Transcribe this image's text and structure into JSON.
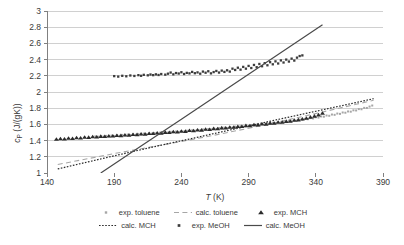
{
  "chart_data": {
    "type": "scatter",
    "title": "",
    "xlabel": "T (K)",
    "ylabel": "cP (J/(gK))",
    "xlim": [
      140,
      390
    ],
    "ylim": [
      1,
      3
    ],
    "xticks": [
      140,
      190,
      240,
      290,
      340,
      390
    ],
    "yticks": [
      1,
      1.2,
      1.4,
      1.6,
      1.8,
      2,
      2.2,
      2.4,
      2.6,
      2.8,
      3
    ],
    "grid": "horizontal",
    "legend_position": "bottom",
    "axis_color": "#808080",
    "grid_color": "#d0d0d0",
    "series": [
      {
        "name": "exp. toluene",
        "key": "exp-toluene",
        "style": "scatter",
        "marker": "square",
        "color": "#a6a6a6",
        "marker_size": 2.0,
        "points": [
          [
            176,
            1.452
          ],
          [
            178,
            1.448
          ],
          [
            180,
            1.455
          ],
          [
            182,
            1.45
          ],
          [
            184,
            1.458
          ],
          [
            186,
            1.452
          ],
          [
            188,
            1.462
          ],
          [
            190,
            1.455
          ],
          [
            192,
            1.468
          ],
          [
            194,
            1.46
          ],
          [
            196,
            1.47
          ],
          [
            198,
            1.464
          ],
          [
            200,
            1.474
          ],
          [
            202,
            1.468
          ],
          [
            204,
            1.478
          ],
          [
            206,
            1.472
          ],
          [
            208,
            1.482
          ],
          [
            210,
            1.476
          ],
          [
            212,
            1.486
          ],
          [
            214,
            1.48
          ],
          [
            216,
            1.49
          ],
          [
            218,
            1.486
          ],
          [
            220,
            1.494
          ],
          [
            222,
            1.49
          ],
          [
            224,
            1.498
          ],
          [
            226,
            1.494
          ],
          [
            228,
            1.503
          ],
          [
            230,
            1.498
          ],
          [
            232,
            1.508
          ],
          [
            234,
            1.503
          ],
          [
            236,
            1.512
          ],
          [
            238,
            1.508
          ],
          [
            240,
            1.517
          ],
          [
            242,
            1.512
          ],
          [
            244,
            1.522
          ],
          [
            246,
            1.518
          ],
          [
            248,
            1.527
          ],
          [
            250,
            1.522
          ],
          [
            252,
            1.532
          ],
          [
            254,
            1.528
          ],
          [
            256,
            1.538
          ],
          [
            258,
            1.533
          ],
          [
            260,
            1.543
          ],
          [
            262,
            1.538
          ],
          [
            264,
            1.548
          ],
          [
            266,
            1.544
          ],
          [
            268,
            1.554
          ],
          [
            270,
            1.549
          ],
          [
            272,
            1.56
          ],
          [
            274,
            1.555
          ],
          [
            276,
            1.566
          ],
          [
            278,
            1.561
          ],
          [
            280,
            1.572
          ],
          [
            282,
            1.567
          ],
          [
            284,
            1.578
          ],
          [
            286,
            1.573
          ],
          [
            288,
            1.584
          ],
          [
            290,
            1.58
          ],
          [
            292,
            1.59
          ],
          [
            294,
            1.586
          ],
          [
            296,
            1.597
          ],
          [
            298,
            1.592
          ],
          [
            300,
            1.604
          ],
          [
            302,
            1.599
          ],
          [
            304,
            1.611
          ],
          [
            306,
            1.606
          ],
          [
            308,
            1.618
          ],
          [
            310,
            1.614
          ],
          [
            312,
            1.626
          ],
          [
            314,
            1.621
          ],
          [
            316,
            1.634
          ],
          [
            318,
            1.629
          ],
          [
            320,
            1.642
          ],
          [
            322,
            1.637
          ],
          [
            324,
            1.65
          ],
          [
            326,
            1.646
          ],
          [
            328,
            1.659
          ],
          [
            330,
            1.655
          ],
          [
            332,
            1.668
          ],
          [
            334,
            1.664
          ],
          [
            336,
            1.678
          ],
          [
            338,
            1.673
          ],
          [
            340,
            1.688
          ],
          [
            342,
            1.684
          ],
          [
            344,
            1.698
          ],
          [
            346,
            1.695
          ],
          [
            348,
            1.71
          ],
          [
            350,
            1.706
          ],
          [
            352,
            1.722
          ],
          [
            354,
            1.718
          ],
          [
            356,
            1.734
          ],
          [
            358,
            1.73
          ],
          [
            360,
            1.747
          ],
          [
            362,
            1.744
          ],
          [
            364,
            1.76
          ],
          [
            366,
            1.757
          ],
          [
            368,
            1.774
          ],
          [
            370,
            1.772
          ],
          [
            372,
            1.789
          ],
          [
            374,
            1.787
          ],
          [
            376,
            1.804
          ],
          [
            378,
            1.803
          ],
          [
            380,
            1.82
          ],
          [
            382,
            1.833
          ]
        ]
      },
      {
        "name": "calc. toluene",
        "key": "calc-toluene",
        "style": "line",
        "dash": "long-dash",
        "color": "#a6a6a6",
        "width": 1.1,
        "points": [
          [
            148,
            1.105
          ],
          [
            170,
            1.175
          ],
          [
            190,
            1.24
          ],
          [
            210,
            1.3
          ],
          [
            230,
            1.36
          ],
          [
            250,
            1.42
          ],
          [
            270,
            1.485
          ],
          [
            290,
            1.552
          ],
          [
            310,
            1.622
          ],
          [
            330,
            1.697
          ],
          [
            350,
            1.772
          ],
          [
            370,
            1.848
          ],
          [
            383,
            1.898
          ]
        ]
      },
      {
        "name": "exp. MCH",
        "key": "exp-mch",
        "style": "scatter",
        "marker": "triangle",
        "color": "#2b2b2b",
        "marker_size": 2.6,
        "points": [
          [
            147,
            1.418
          ],
          [
            150,
            1.424
          ],
          [
            153,
            1.42
          ],
          [
            156,
            1.43
          ],
          [
            159,
            1.426
          ],
          [
            162,
            1.436
          ],
          [
            165,
            1.432
          ],
          [
            168,
            1.442
          ],
          [
            171,
            1.44
          ],
          [
            174,
            1.448
          ],
          [
            177,
            1.444
          ],
          [
            180,
            1.452
          ],
          [
            183,
            1.45
          ],
          [
            186,
            1.458
          ],
          [
            189,
            1.456
          ],
          [
            192,
            1.464
          ],
          [
            195,
            1.462
          ],
          [
            198,
            1.47
          ],
          [
            201,
            1.468
          ],
          [
            204,
            1.476
          ],
          [
            207,
            1.474
          ],
          [
            210,
            1.482
          ],
          [
            213,
            1.48
          ],
          [
            216,
            1.489
          ],
          [
            219,
            1.487
          ],
          [
            222,
            1.495
          ],
          [
            225,
            1.493
          ],
          [
            228,
            1.502
          ],
          [
            231,
            1.5
          ],
          [
            234,
            1.509
          ],
          [
            237,
            1.507
          ],
          [
            240,
            1.516
          ],
          [
            243,
            1.514
          ],
          [
            246,
            1.524
          ],
          [
            249,
            1.522
          ],
          [
            252,
            1.532
          ],
          [
            255,
            1.53
          ],
          [
            258,
            1.54
          ],
          [
            261,
            1.538
          ],
          [
            264,
            1.548
          ],
          [
            267,
            1.547
          ],
          [
            270,
            1.557
          ],
          [
            273,
            1.556
          ],
          [
            276,
            1.566
          ],
          [
            279,
            1.565
          ],
          [
            282,
            1.575
          ],
          [
            285,
            1.574
          ],
          [
            288,
            1.585
          ],
          [
            291,
            1.584
          ],
          [
            294,
            1.595
          ],
          [
            297,
            1.594
          ],
          [
            300,
            1.605
          ],
          [
            303,
            1.604
          ],
          [
            306,
            1.616
          ],
          [
            309,
            1.615
          ],
          [
            312,
            1.627
          ],
          [
            315,
            1.626
          ],
          [
            318,
            1.638
          ],
          [
            321,
            1.64
          ],
          [
            324,
            1.652
          ],
          [
            327,
            1.656
          ],
          [
            330,
            1.668
          ],
          [
            333,
            1.676
          ],
          [
            336,
            1.69
          ],
          [
            339,
            1.702
          ],
          [
            342,
            1.718
          ],
          [
            345,
            1.738
          ]
        ]
      },
      {
        "name": "calc. MCH",
        "key": "calc-mch",
        "style": "line",
        "dash": "dotted",
        "color": "#2b2b2b",
        "width": 1.2,
        "points": [
          [
            148,
            1.05
          ],
          [
            170,
            1.135
          ],
          [
            190,
            1.212
          ],
          [
            210,
            1.288
          ],
          [
            230,
            1.362
          ],
          [
            250,
            1.434
          ],
          [
            270,
            1.508
          ],
          [
            290,
            1.58
          ],
          [
            310,
            1.654
          ],
          [
            330,
            1.726
          ],
          [
            350,
            1.798
          ],
          [
            370,
            1.87
          ],
          [
            383,
            1.918
          ]
        ]
      },
      {
        "name": "exp. MeOH",
        "key": "exp-meoh",
        "style": "scatter",
        "marker": "square",
        "color": "#3c3c3c",
        "marker_size": 2.3,
        "points": [
          [
            190,
            2.196
          ],
          [
            193,
            2.19
          ],
          [
            196,
            2.2
          ],
          [
            199,
            2.194
          ],
          [
            202,
            2.204
          ],
          [
            205,
            2.198
          ],
          [
            208,
            2.208
          ],
          [
            210,
            2.2
          ],
          [
            212,
            2.212
          ],
          [
            215,
            2.206
          ],
          [
            217,
            2.216
          ],
          [
            219,
            2.208
          ],
          [
            221,
            2.218
          ],
          [
            223,
            2.21
          ],
          [
            225,
            2.222
          ],
          [
            228,
            2.214
          ],
          [
            230,
            2.226
          ],
          [
            232,
            2.24
          ],
          [
            234,
            2.218
          ],
          [
            236,
            2.234
          ],
          [
            238,
            2.228
          ],
          [
            240,
            2.244
          ],
          [
            242,
            2.222
          ],
          [
            244,
            2.236
          ],
          [
            246,
            2.23
          ],
          [
            248,
            2.248
          ],
          [
            250,
            2.232
          ],
          [
            252,
            2.242
          ],
          [
            254,
            2.226
          ],
          [
            256,
            2.252
          ],
          [
            258,
            2.238
          ],
          [
            260,
            2.256
          ],
          [
            262,
            2.23
          ],
          [
            264,
            2.246
          ],
          [
            266,
            2.26
          ],
          [
            268,
            2.24
          ],
          [
            270,
            2.264
          ],
          [
            272,
            2.248
          ],
          [
            274,
            2.268
          ],
          [
            276,
            2.252
          ],
          [
            278,
            2.288
          ],
          [
            280,
            2.272
          ],
          [
            282,
            2.3
          ],
          [
            284,
            2.276
          ],
          [
            286,
            2.31
          ],
          [
            288,
            2.288
          ],
          [
            290,
            2.322
          ],
          [
            292,
            2.296
          ],
          [
            294,
            2.334
          ],
          [
            296,
            2.306
          ],
          [
            298,
            2.346
          ],
          [
            300,
            2.318
          ],
          [
            302,
            2.356
          ],
          [
            304,
            2.33
          ],
          [
            306,
            2.368
          ],
          [
            308,
            2.342
          ],
          [
            310,
            2.378
          ],
          [
            312,
            2.352
          ],
          [
            314,
            2.39
          ],
          [
            316,
            2.364
          ],
          [
            318,
            2.4
          ],
          [
            320,
            2.376
          ],
          [
            322,
            2.412
          ],
          [
            324,
            2.388
          ],
          [
            326,
            2.424
          ],
          [
            328,
            2.444
          ],
          [
            330,
            2.452
          ]
        ]
      },
      {
        "name": "calc. MeOH",
        "key": "calc-meoh",
        "style": "line",
        "dash": "solid",
        "color": "#4a4a4a",
        "width": 1.2,
        "points": [
          [
            180,
            1.0
          ],
          [
            210,
            1.333
          ],
          [
            240,
            1.665
          ],
          [
            270,
            1.998
          ],
          [
            300,
            2.33
          ],
          [
            330,
            2.663
          ],
          [
            345,
            2.83
          ]
        ]
      }
    ]
  },
  "legend": {
    "rows": [
      [
        {
          "label": "exp. toluene",
          "key": "exp-toluene"
        },
        {
          "label": "calc. toluene",
          "key": "calc-toluene"
        },
        {
          "label": "exp. MCH",
          "key": "exp-mch"
        }
      ],
      [
        {
          "label": "calc. MCH",
          "key": "calc-mch"
        },
        {
          "label": "exp. MeOH",
          "key": "exp-meoh"
        },
        {
          "label": "calc. MeOH",
          "key": "calc-meoh"
        }
      ]
    ]
  },
  "axes": {
    "y_title_main": "c",
    "y_title_sub": "P",
    "y_title_unit": " (J/(gK))",
    "x_title_var": "T",
    "x_title_unit": " (K)"
  }
}
